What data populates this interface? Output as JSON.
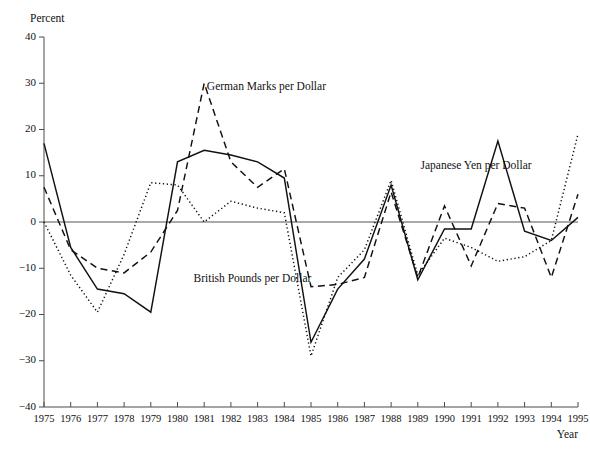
{
  "chart_data": {
    "type": "line",
    "title": "",
    "xlabel": "Year",
    "ylabel": "Percent",
    "xlim": [
      1975,
      1995
    ],
    "ylim": [
      -40,
      40
    ],
    "yticks": [
      40,
      30,
      20,
      10,
      0,
      -10,
      -20,
      -30,
      -40
    ],
    "ytick_labels": [
      "40",
      "30",
      "20",
      "10",
      "0",
      "−10",
      "−20",
      "−30",
      "−40"
    ],
    "x": [
      1975,
      1976,
      1977,
      1978,
      1979,
      1980,
      1981,
      1982,
      1983,
      1984,
      1985,
      1986,
      1987,
      1988,
      1989,
      1990,
      1991,
      1992,
      1993,
      1994,
      1995
    ],
    "xtick_labels": [
      "1975",
      "1976",
      "1977",
      "1978",
      "1979",
      "1980",
      "1981",
      "1982",
      "1983",
      "1984",
      "1985",
      "1986",
      "1987",
      "1988",
      "1989",
      "1990",
      "1991",
      "1992",
      "1993",
      "1994",
      "1995"
    ],
    "grid": false,
    "legend_position": "inline-annotations",
    "series": [
      {
        "name": "British Pounds per Dollar",
        "style": "solid",
        "label_x": 1980.6,
        "label_y": -13.0,
        "values": [
          17.0,
          -5.5,
          -14.5,
          -15.5,
          -19.5,
          13.0,
          15.5,
          14.5,
          13.0,
          9.5,
          -26.0,
          -14.5,
          -8.0,
          8.0,
          -12.5,
          -1.5,
          -1.5,
          17.5,
          -2.0,
          -4.0,
          1.0
        ]
      },
      {
        "name": "German Marks per Dollar",
        "style": "dashed",
        "label_x": 1981.1,
        "label_y": 28.5,
        "values": [
          7.5,
          -6.0,
          -10.0,
          -11.0,
          -6.5,
          2.5,
          30.0,
          13.0,
          7.5,
          11.5,
          -14.0,
          -13.5,
          -12.0,
          6.5,
          -12.0,
          3.5,
          -9.5,
          4.0,
          3.0,
          -12.0,
          6.0
        ]
      },
      {
        "name": "Japanese Yen per Dollar",
        "style": "dotted",
        "label_x": 1989.1,
        "label_y": 11.5,
        "values": [
          0.0,
          -11.5,
          -19.5,
          -7.0,
          8.5,
          8.0,
          0.0,
          4.5,
          3.0,
          2.0,
          -29.0,
          -12.0,
          -6.0,
          9.0,
          -11.5,
          -3.5,
          -5.5,
          -8.5,
          -7.5,
          -4.0,
          19.0
        ]
      }
    ]
  },
  "axis": {
    "y_title": "Percent",
    "x_title": "Year"
  }
}
